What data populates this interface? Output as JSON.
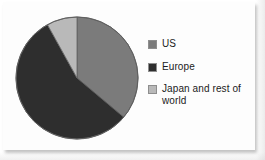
{
  "chart_data": {
    "type": "pie",
    "title": "",
    "subtitle": "",
    "xlabel": "",
    "ylabel": "",
    "grid": false,
    "legend_position": "right",
    "start_angle_deg": 0,
    "direction": "clockwise",
    "center": {
      "cx": 67,
      "cy": 70
    },
    "radius": 61,
    "categories": [
      "US",
      "Europe",
      "Japan and rest of world"
    ],
    "values": [
      36,
      56,
      8
    ],
    "units": "percent",
    "slices": [
      {
        "label": "US",
        "value": 36,
        "color": "#7b7b7b",
        "start_deg": 0,
        "end_deg": 130
      },
      {
        "label": "Europe",
        "value": 56,
        "color": "#2e2e2e",
        "start_deg": 130,
        "end_deg": 331
      },
      {
        "label": "Japan and rest of world",
        "value": 8,
        "color": "#b9b9b9",
        "start_deg": 331,
        "end_deg": 360
      }
    ]
  },
  "chart": {
    "outline_color": "#5a5a5a",
    "background": "#fdfdfd"
  },
  "legend": {
    "items": [
      {
        "label": "US",
        "color": "#7b7b7b"
      },
      {
        "label": "Europe",
        "color": "#2e2e2e"
      },
      {
        "label": "Japan and rest of world",
        "color": "#b9b9b9"
      }
    ]
  }
}
